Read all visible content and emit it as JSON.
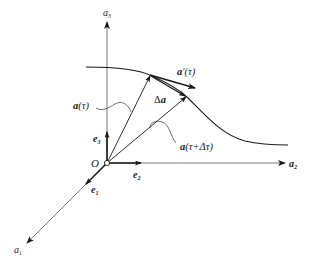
{
  "figure": {
    "type": "vector-derivative-diagram",
    "axes": {
      "a1": {
        "label": "a",
        "subscript": "1"
      },
      "a2": {
        "label": "a",
        "subscript": "2"
      },
      "a3": {
        "label": "a",
        "subscript": "3"
      }
    },
    "origin_label": "O",
    "basis_vectors": {
      "e1": {
        "label": "e",
        "subscript": "1"
      },
      "e2": {
        "label": "e",
        "subscript": "2"
      },
      "e3": {
        "label": "e",
        "subscript": "3"
      }
    },
    "vectors": {
      "position_tau": {
        "name": "a",
        "arg": "(τ)"
      },
      "position_tau_dt": {
        "name": "a",
        "arg": "(τ+Δτ)"
      },
      "delta": {
        "prefix": "Δ",
        "name": "a"
      },
      "derivative": {
        "name": "a",
        "prime": "′",
        "arg": "(τ)"
      }
    },
    "colors": {
      "line": "#1a1a1a",
      "axis": "#555555",
      "background": "#ffffff"
    }
  }
}
